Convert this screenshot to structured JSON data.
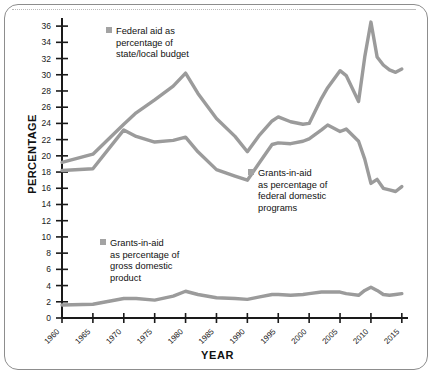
{
  "chart_data": {
    "type": "line",
    "title": "",
    "xlabel": "YEAR",
    "ylabel": "PERCENTAGE",
    "xlim": [
      1960,
      2016
    ],
    "ylim": [
      0,
      37
    ],
    "yticks": [
      0,
      2,
      4,
      6,
      8,
      10,
      12,
      14,
      16,
      18,
      20,
      22,
      24,
      26,
      28,
      30,
      32,
      34,
      36
    ],
    "xticks": [
      1960,
      1965,
      1970,
      1975,
      1980,
      1985,
      1990,
      1995,
      2000,
      2005,
      2010,
      2015
    ],
    "xtick_labels": [
      "1960",
      "1965",
      "1970",
      "1975",
      "1980",
      "1985",
      "1990",
      "1995",
      "2000",
      "2005",
      "2010",
      "2015"
    ],
    "grid": false,
    "legend_position": "inline-annotations",
    "line_color": "#9b9b9b",
    "axis_color": "#1a1a1a",
    "series": [
      {
        "name": "Federal aid as percentage of state/local budget",
        "color": "#9b9b9b",
        "x": [
          1960,
          1965,
          1970,
          1972,
          1975,
          1978,
          1980,
          1982,
          1985,
          1988,
          1990,
          1992,
          1994,
          1995,
          1997,
          1999,
          2000,
          2002,
          2003,
          2005,
          2006,
          2008,
          2009,
          2010,
          2011,
          2012,
          2013,
          2014,
          2015
        ],
        "values": [
          19.2,
          20.2,
          23.9,
          25.3,
          26.9,
          28.6,
          30.2,
          27.7,
          24.6,
          22.4,
          20.5,
          22.6,
          24.3,
          24.8,
          24.2,
          23.9,
          24.0,
          27.1,
          28.4,
          30.5,
          29.9,
          26.7,
          32.2,
          36.5,
          32.2,
          31.2,
          30.6,
          30.3,
          30.7
        ]
      },
      {
        "name": "Grants-in-aid as percentage of federal domestic programs",
        "color": "#9b9b9b",
        "x": [
          1960,
          1965,
          1970,
          1972,
          1975,
          1978,
          1980,
          1982,
          1985,
          1988,
          1990,
          1992,
          1994,
          1995,
          1997,
          1999,
          2000,
          2002,
          2003,
          2005,
          2006,
          2008,
          2009,
          2010,
          2011,
          2012,
          2013,
          2014,
          2015
        ],
        "values": [
          18.2,
          18.4,
          23.2,
          22.4,
          21.7,
          21.9,
          22.3,
          20.5,
          18.3,
          17.5,
          17.0,
          19.2,
          21.4,
          21.6,
          21.5,
          21.8,
          22.1,
          23.2,
          23.8,
          23.0,
          23.3,
          21.8,
          19.6,
          16.6,
          17.1,
          16.0,
          15.8,
          15.6,
          16.2
        ]
      },
      {
        "name": "Grants-in-aid as percentage of gross domestic product",
        "color": "#9b9b9b",
        "x": [
          1960,
          1965,
          1970,
          1972,
          1975,
          1978,
          1980,
          1982,
          1985,
          1988,
          1990,
          1992,
          1994,
          1995,
          1997,
          1999,
          2000,
          2002,
          2003,
          2005,
          2006,
          2008,
          2009,
          2010,
          2011,
          2012,
          2013,
          2014,
          2015
        ],
        "values": [
          1.6,
          1.7,
          2.4,
          2.4,
          2.2,
          2.7,
          3.3,
          2.9,
          2.5,
          2.4,
          2.3,
          2.6,
          2.9,
          2.9,
          2.8,
          2.9,
          3.0,
          3.2,
          3.2,
          3.2,
          3.0,
          2.8,
          3.4,
          3.8,
          3.4,
          2.9,
          2.8,
          2.9,
          3.0
        ]
      }
    ]
  },
  "axes": {
    "y_title": "PERCENTAGE",
    "x_title": "YEAR"
  },
  "legends": {
    "federal": {
      "line1": "Federal aid as",
      "line2": "percentage of",
      "line3": "state/local budget"
    },
    "domestic": {
      "line1": "Grants-in-aid",
      "line2": "as percentage of",
      "line3": "federal domestic",
      "line4": "programs"
    },
    "gdp": {
      "line1": "Grants-in-aid",
      "line2": "as percentage of",
      "line3": "gross domestic",
      "line4": "product"
    }
  }
}
